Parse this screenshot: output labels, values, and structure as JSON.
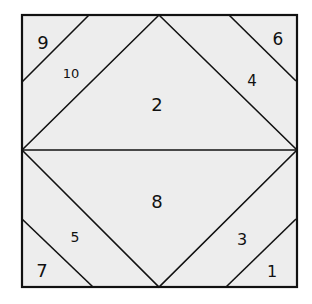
{
  "diagram": {
    "type": "quilt-block-piecing-diagram",
    "background": "#ededed",
    "line_color": "#111111",
    "pieces": [
      {
        "id": "1",
        "label": "1",
        "x": 272,
        "y": 272,
        "size": 16
      },
      {
        "id": "2",
        "label": "2",
        "x": 157,
        "y": 106,
        "size": 18
      },
      {
        "id": "3",
        "label": "3",
        "x": 242,
        "y": 240,
        "size": 16
      },
      {
        "id": "4",
        "label": "4",
        "x": 252,
        "y": 81,
        "size": 15
      },
      {
        "id": "5",
        "label": "5",
        "x": 75,
        "y": 238,
        "size": 14
      },
      {
        "id": "6",
        "label": "6",
        "x": 278,
        "y": 40,
        "size": 17
      },
      {
        "id": "7",
        "label": "7",
        "x": 42,
        "y": 272,
        "size": 18
      },
      {
        "id": "8",
        "label": "8",
        "x": 157,
        "y": 203,
        "size": 18
      },
      {
        "id": "9",
        "label": "9",
        "x": 43,
        "y": 44,
        "size": 18
      },
      {
        "id": "10",
        "label": "10",
        "x": 71,
        "y": 74,
        "size": 13
      }
    ]
  }
}
